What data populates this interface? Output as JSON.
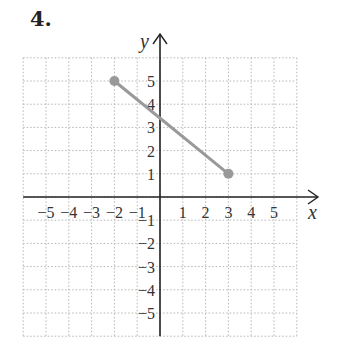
{
  "problem": {
    "number": "4."
  },
  "chart_data": {
    "type": "line",
    "title": "",
    "xlabel": "x",
    "ylabel": "y",
    "xlim": [
      -6,
      6
    ],
    "ylim": [
      -6,
      6
    ],
    "grid": true,
    "grid_style": "dotted",
    "x_ticks": [
      -5,
      -4,
      -3,
      -2,
      -1,
      1,
      2,
      3,
      4,
      5
    ],
    "y_ticks": [
      5,
      4,
      3,
      2,
      1,
      -1,
      -2,
      -3,
      -4,
      -5
    ],
    "x_tick_labels": [
      "−5",
      "−4",
      "−3",
      "−2",
      "−1",
      "1",
      "2",
      "3",
      "4",
      "5"
    ],
    "y_tick_labels": [
      "5",
      "4",
      "3",
      "2",
      "1",
      "−1",
      "−2",
      "−3",
      "−4",
      "−5"
    ],
    "series": [
      {
        "name": "segment",
        "color": "#999999",
        "points": [
          {
            "x": -2,
            "y": 5
          },
          {
            "x": 3,
            "y": 1
          }
        ],
        "endpoints": "filled-circles"
      }
    ]
  },
  "colors": {
    "axis": "#222222",
    "grid": "#b5b5b5",
    "segment": "#999999"
  }
}
